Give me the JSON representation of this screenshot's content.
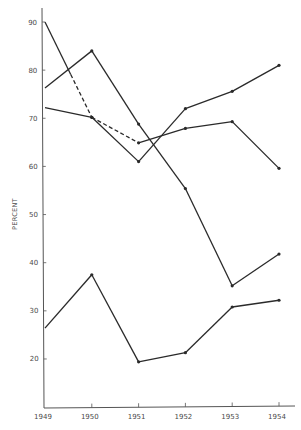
{
  "chart_data": {
    "type": "line",
    "title": "",
    "xlabel": "",
    "ylabel": "PERCENT",
    "categories": [
      "1949",
      "1950",
      "1951",
      "1952",
      "1953",
      "1954"
    ],
    "x_ticks": [
      "1949",
      "1950",
      "1951",
      "1952",
      "1953",
      "1954"
    ],
    "y_ticks": [
      20,
      30,
      40,
      50,
      60,
      70,
      80,
      90
    ],
    "ylim": [
      10,
      92
    ],
    "grid": false,
    "legend": null,
    "series": [
      {
        "name": "Series A",
        "values": [
          90,
          70.2,
          64.9,
          67.9,
          69.3,
          59.6
        ],
        "dashed_segments": [
          [
            0.55,
            1
          ],
          [
            1,
            2
          ]
        ],
        "markers": [
          false,
          true,
          true,
          true,
          true,
          true
        ]
      },
      {
        "name": "Series B",
        "values": [
          72.2,
          70.2,
          61,
          72,
          75.6,
          81
        ],
        "markers": [
          false,
          true,
          true,
          true,
          true,
          true
        ]
      },
      {
        "name": "Series C",
        "values": [
          76.3,
          84,
          68.8,
          55.4,
          35.2,
          41.8
        ],
        "markers": [
          false,
          true,
          true,
          true,
          true,
          true
        ]
      },
      {
        "name": "Series D",
        "values": [
          26.4,
          37.5,
          19.4,
          21.3,
          30.8,
          32.2
        ],
        "markers": [
          false,
          true,
          true,
          true,
          true,
          true
        ]
      }
    ],
    "colors": {
      "line": "#2a2a2a",
      "axis": "#555555",
      "text": "#4a4a4a"
    }
  }
}
